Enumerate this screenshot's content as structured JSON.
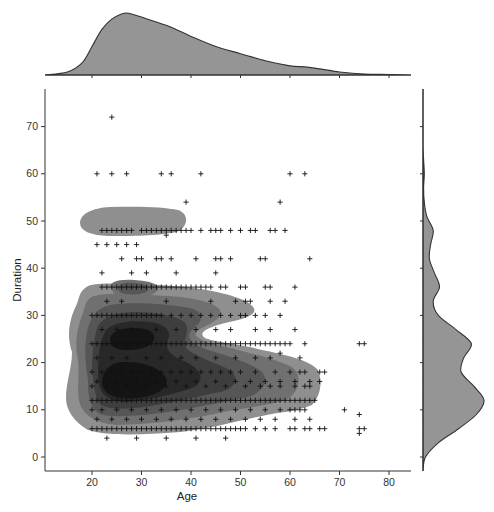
{
  "chart_data": {
    "type": "jointplot",
    "subtype": "kde + scatter",
    "title": "",
    "xlabel": "Age",
    "ylabel": "Duration",
    "xlim": [
      10.3,
      84
    ],
    "ylim": [
      -3,
      79
    ],
    "xticks": [
      20,
      30,
      40,
      50,
      60,
      70,
      80
    ],
    "yticks": [
      0,
      10,
      20,
      30,
      40,
      50,
      60,
      70
    ],
    "grid": false,
    "marker": "+",
    "marker_color": "#111111",
    "kde_colors": [
      "#8f8f8f",
      "#707070",
      "#565656",
      "#3e3e3e",
      "#282828",
      "#141414"
    ],
    "marginal_color": "#959595",
    "scatter_points": [
      [
        24,
        72
      ],
      [
        21,
        60
      ],
      [
        24,
        60
      ],
      [
        27,
        60
      ],
      [
        34,
        60
      ],
      [
        36,
        60
      ],
      [
        42,
        60
      ],
      [
        60,
        60
      ],
      [
        63,
        60
      ],
      [
        39,
        54
      ],
      [
        58,
        54
      ],
      [
        22,
        48
      ],
      [
        23,
        48
      ],
      [
        24,
        48
      ],
      [
        25,
        48
      ],
      [
        26,
        48
      ],
      [
        27,
        48
      ],
      [
        28,
        48
      ],
      [
        30,
        48
      ],
      [
        31,
        48
      ],
      [
        32,
        48
      ],
      [
        33,
        48
      ],
      [
        34,
        48
      ],
      [
        35,
        48
      ],
      [
        36,
        48
      ],
      [
        37,
        48
      ],
      [
        38,
        48
      ],
      [
        39,
        48
      ],
      [
        40,
        48
      ],
      [
        42,
        48
      ],
      [
        44,
        48
      ],
      [
        45,
        48
      ],
      [
        46,
        48
      ],
      [
        48,
        48
      ],
      [
        50,
        48
      ],
      [
        52,
        48
      ],
      [
        53,
        48
      ],
      [
        56,
        48
      ],
      [
        57,
        48
      ],
      [
        59,
        48
      ],
      [
        21,
        45
      ],
      [
        23,
        45
      ],
      [
        25,
        45
      ],
      [
        27,
        45
      ],
      [
        29,
        45
      ],
      [
        35,
        47
      ],
      [
        26,
        42
      ],
      [
        29,
        42
      ],
      [
        30,
        42
      ],
      [
        33,
        42
      ],
      [
        34,
        42
      ],
      [
        36,
        42
      ],
      [
        41,
        42
      ],
      [
        45,
        42
      ],
      [
        46,
        42
      ],
      [
        48,
        42
      ],
      [
        54,
        42
      ],
      [
        55,
        42
      ],
      [
        64,
        42
      ],
      [
        22,
        39
      ],
      [
        28,
        39
      ],
      [
        31,
        39
      ],
      [
        37,
        39
      ],
      [
        45,
        39
      ],
      [
        22,
        36
      ],
      [
        23,
        36
      ],
      [
        24,
        36
      ],
      [
        25,
        36
      ],
      [
        26,
        36
      ],
      [
        27,
        36
      ],
      [
        28,
        36
      ],
      [
        29,
        36
      ],
      [
        30,
        36
      ],
      [
        31,
        36
      ],
      [
        32,
        36
      ],
      [
        33,
        36
      ],
      [
        34,
        36
      ],
      [
        35,
        36
      ],
      [
        36,
        36
      ],
      [
        37,
        36
      ],
      [
        38,
        36
      ],
      [
        39,
        36
      ],
      [
        40,
        36
      ],
      [
        41,
        36
      ],
      [
        42,
        36
      ],
      [
        43,
        36
      ],
      [
        44,
        36
      ],
      [
        46,
        36
      ],
      [
        47,
        36
      ],
      [
        50,
        36
      ],
      [
        51,
        36
      ],
      [
        55,
        36
      ],
      [
        56,
        36
      ],
      [
        61,
        36
      ],
      [
        23,
        33
      ],
      [
        26,
        33
      ],
      [
        35,
        33
      ],
      [
        44,
        33
      ],
      [
        49,
        33
      ],
      [
        51,
        33
      ],
      [
        52,
        33
      ],
      [
        56,
        33
      ],
      [
        59,
        33
      ],
      [
        20,
        30
      ],
      [
        21,
        30
      ],
      [
        22,
        30
      ],
      [
        23,
        30
      ],
      [
        24,
        30
      ],
      [
        25,
        30
      ],
      [
        26,
        30
      ],
      [
        27,
        30
      ],
      [
        28,
        30
      ],
      [
        29,
        30
      ],
      [
        30,
        30
      ],
      [
        31,
        30
      ],
      [
        32,
        30
      ],
      [
        33,
        30
      ],
      [
        34,
        30
      ],
      [
        36,
        30
      ],
      [
        38,
        30
      ],
      [
        40,
        30
      ],
      [
        42,
        30
      ],
      [
        44,
        30
      ],
      [
        46,
        30
      ],
      [
        48,
        30
      ],
      [
        50,
        30
      ],
      [
        51,
        30
      ],
      [
        53,
        30
      ],
      [
        55,
        30
      ],
      [
        58,
        30
      ],
      [
        22,
        27
      ],
      [
        25,
        27
      ],
      [
        28,
        27
      ],
      [
        33,
        27
      ],
      [
        37,
        27
      ],
      [
        41,
        27
      ],
      [
        45,
        27
      ],
      [
        48,
        27
      ],
      [
        53,
        27
      ],
      [
        56,
        27
      ],
      [
        61,
        27
      ],
      [
        20,
        24
      ],
      [
        21,
        24
      ],
      [
        22,
        24
      ],
      [
        23,
        24
      ],
      [
        24,
        24
      ],
      [
        25,
        24
      ],
      [
        26,
        24
      ],
      [
        27,
        24
      ],
      [
        28,
        24
      ],
      [
        29,
        24
      ],
      [
        30,
        24
      ],
      [
        31,
        24
      ],
      [
        32,
        24
      ],
      [
        33,
        24
      ],
      [
        34,
        24
      ],
      [
        35,
        24
      ],
      [
        36,
        24
      ],
      [
        37,
        24
      ],
      [
        38,
        24
      ],
      [
        39,
        24
      ],
      [
        40,
        24
      ],
      [
        41,
        24
      ],
      [
        42,
        24
      ],
      [
        43,
        24
      ],
      [
        44,
        24
      ],
      [
        45,
        24
      ],
      [
        46,
        24
      ],
      [
        47,
        24
      ],
      [
        48,
        24
      ],
      [
        49,
        24
      ],
      [
        50,
        24
      ],
      [
        51,
        24
      ],
      [
        52,
        24
      ],
      [
        53,
        24
      ],
      [
        54,
        24
      ],
      [
        55,
        24
      ],
      [
        56,
        24
      ],
      [
        57,
        24
      ],
      [
        58,
        24
      ],
      [
        59,
        24
      ],
      [
        60,
        24
      ],
      [
        63,
        24
      ],
      [
        74,
        24
      ],
      [
        75,
        24
      ],
      [
        21,
        21
      ],
      [
        24,
        21
      ],
      [
        27,
        21
      ],
      [
        31,
        21
      ],
      [
        34,
        21
      ],
      [
        38,
        21
      ],
      [
        41,
        21
      ],
      [
        45,
        21
      ],
      [
        49,
        21
      ],
      [
        53,
        21
      ],
      [
        56,
        21
      ],
      [
        58,
        22
      ],
      [
        62,
        21
      ],
      [
        20,
        18
      ],
      [
        22,
        18
      ],
      [
        24,
        18
      ],
      [
        26,
        18
      ],
      [
        28,
        18
      ],
      [
        30,
        18
      ],
      [
        32,
        18
      ],
      [
        34,
        18
      ],
      [
        36,
        18
      ],
      [
        38,
        18
      ],
      [
        40,
        18
      ],
      [
        42,
        18
      ],
      [
        44,
        18
      ],
      [
        46,
        18
      ],
      [
        48,
        18
      ],
      [
        50,
        18
      ],
      [
        53,
        18
      ],
      [
        57,
        18
      ],
      [
        60,
        18
      ],
      [
        62,
        18
      ],
      [
        63,
        18
      ],
      [
        66,
        18
      ],
      [
        67,
        18
      ],
      [
        21,
        16
      ],
      [
        25,
        16
      ],
      [
        29,
        16
      ],
      [
        33,
        16
      ],
      [
        37,
        16
      ],
      [
        41,
        16
      ],
      [
        45,
        16
      ],
      [
        49,
        16
      ],
      [
        52,
        16
      ],
      [
        55,
        16
      ],
      [
        58,
        16
      ],
      [
        61,
        16
      ],
      [
        64,
        16
      ],
      [
        66,
        16
      ],
      [
        20,
        15
      ],
      [
        23,
        15
      ],
      [
        27,
        15
      ],
      [
        31,
        15
      ],
      [
        35,
        15
      ],
      [
        39,
        15
      ],
      [
        43,
        15
      ],
      [
        47,
        15
      ],
      [
        51,
        15
      ],
      [
        54,
        15
      ],
      [
        56,
        15
      ],
      [
        58,
        15
      ],
      [
        61,
        15
      ],
      [
        63,
        15
      ],
      [
        64,
        15
      ],
      [
        20,
        12
      ],
      [
        21,
        12
      ],
      [
        22,
        12
      ],
      [
        23,
        12
      ],
      [
        24,
        12
      ],
      [
        25,
        12
      ],
      [
        26,
        12
      ],
      [
        27,
        12
      ],
      [
        28,
        12
      ],
      [
        29,
        12
      ],
      [
        30,
        12
      ],
      [
        31,
        12
      ],
      [
        32,
        12
      ],
      [
        33,
        12
      ],
      [
        34,
        12
      ],
      [
        35,
        12
      ],
      [
        36,
        12
      ],
      [
        37,
        12
      ],
      [
        38,
        12
      ],
      [
        39,
        12
      ],
      [
        40,
        12
      ],
      [
        41,
        12
      ],
      [
        42,
        12
      ],
      [
        43,
        12
      ],
      [
        44,
        12
      ],
      [
        45,
        12
      ],
      [
        46,
        12
      ],
      [
        47,
        12
      ],
      [
        48,
        12
      ],
      [
        49,
        12
      ],
      [
        50,
        12
      ],
      [
        51,
        12
      ],
      [
        52,
        12
      ],
      [
        53,
        12
      ],
      [
        54,
        12
      ],
      [
        55,
        12
      ],
      [
        56,
        12
      ],
      [
        57,
        12
      ],
      [
        58,
        12
      ],
      [
        59,
        12
      ],
      [
        60,
        12
      ],
      [
        61,
        12
      ],
      [
        62,
        12
      ],
      [
        63,
        12
      ],
      [
        64,
        12
      ],
      [
        65,
        12
      ],
      [
        20,
        10
      ],
      [
        22,
        10
      ],
      [
        25,
        10
      ],
      [
        28,
        10
      ],
      [
        31,
        10
      ],
      [
        34,
        10
      ],
      [
        37,
        10
      ],
      [
        40,
        10
      ],
      [
        43,
        10
      ],
      [
        46,
        10
      ],
      [
        49,
        10
      ],
      [
        52,
        10
      ],
      [
        55,
        10
      ],
      [
        58,
        10
      ],
      [
        60,
        10
      ],
      [
        61,
        10
      ],
      [
        62,
        10
      ],
      [
        63,
        10
      ],
      [
        71,
        10
      ],
      [
        74,
        9
      ],
      [
        21,
        8
      ],
      [
        24,
        8
      ],
      [
        27,
        8
      ],
      [
        30,
        8
      ],
      [
        33,
        8
      ],
      [
        36,
        8
      ],
      [
        39,
        8
      ],
      [
        42,
        8
      ],
      [
        45,
        8
      ],
      [
        48,
        8
      ],
      [
        51,
        8
      ],
      [
        54,
        8
      ],
      [
        57,
        8
      ],
      [
        61,
        8
      ],
      [
        64,
        8
      ],
      [
        20,
        6
      ],
      [
        21,
        6
      ],
      [
        22,
        6
      ],
      [
        23,
        6
      ],
      [
        24,
        6
      ],
      [
        25,
        6
      ],
      [
        26,
        6
      ],
      [
        27,
        6
      ],
      [
        28,
        6
      ],
      [
        29,
        6
      ],
      [
        30,
        6
      ],
      [
        31,
        6
      ],
      [
        32,
        6
      ],
      [
        33,
        6
      ],
      [
        34,
        6
      ],
      [
        35,
        6
      ],
      [
        36,
        6
      ],
      [
        37,
        6
      ],
      [
        38,
        6
      ],
      [
        39,
        6
      ],
      [
        40,
        6
      ],
      [
        41,
        6
      ],
      [
        42,
        6
      ],
      [
        43,
        6
      ],
      [
        44,
        6
      ],
      [
        45,
        6
      ],
      [
        46,
        6
      ],
      [
        47,
        6
      ],
      [
        48,
        6
      ],
      [
        49,
        6
      ],
      [
        50,
        6
      ],
      [
        51,
        6
      ],
      [
        53,
        6
      ],
      [
        55,
        6
      ],
      [
        57,
        6
      ],
      [
        60,
        6
      ],
      [
        61,
        6
      ],
      [
        63,
        6
      ],
      [
        64,
        6
      ],
      [
        66,
        6
      ],
      [
        67,
        6
      ],
      [
        74,
        6
      ],
      [
        75,
        6
      ],
      [
        74,
        5
      ],
      [
        23,
        4
      ],
      [
        29,
        4
      ],
      [
        35,
        4
      ],
      [
        41,
        4
      ],
      [
        47,
        4
      ]
    ],
    "marginal_x": {
      "variable": "Age",
      "peak_at": 27,
      "x": [
        10,
        15,
        18,
        20,
        22,
        24,
        26,
        27,
        28,
        30,
        33,
        36,
        40,
        45,
        50,
        55,
        60,
        63,
        66,
        70,
        75,
        80,
        84
      ],
      "density": [
        0.0,
        0.003,
        0.012,
        0.028,
        0.045,
        0.055,
        0.06,
        0.061,
        0.06,
        0.057,
        0.052,
        0.047,
        0.038,
        0.028,
        0.021,
        0.014,
        0.009,
        0.008,
        0.006,
        0.003,
        0.001,
        0.0005,
        0.0
      ]
    },
    "marginal_y": {
      "variable": "Duration",
      "peaks_at": [
        12,
        24,
        36,
        48
      ],
      "y": [
        -3,
        0,
        3,
        6,
        9,
        12,
        15,
        18,
        21,
        24,
        27,
        30,
        33,
        36,
        39,
        42,
        45,
        48,
        51,
        54,
        57,
        60,
        63,
        66,
        72
      ],
      "density": [
        0.0,
        0.002,
        0.012,
        0.028,
        0.042,
        0.048,
        0.04,
        0.03,
        0.032,
        0.038,
        0.026,
        0.012,
        0.008,
        0.013,
        0.009,
        0.005,
        0.006,
        0.008,
        0.003,
        0.001,
        0.0005,
        0.001,
        0.0005,
        0.0,
        0.0
      ]
    }
  }
}
